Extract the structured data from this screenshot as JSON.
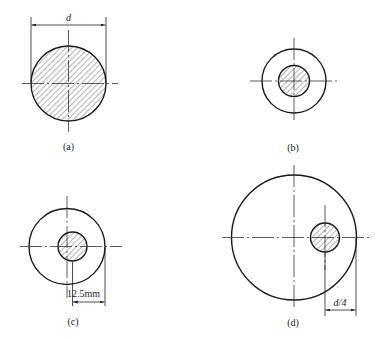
{
  "figures": [
    {
      "id": "a",
      "caption": "(a)",
      "description": "Solid round bar cross-section, fully hatched",
      "dimension": {
        "label": "d",
        "type": "diameter"
      }
    },
    {
      "id": "b",
      "caption": "(b)",
      "description": "Concentric hollow ring with hatched inner core"
    },
    {
      "id": "c",
      "caption": "(c)",
      "description": "Ring with hatched core slightly offset from center",
      "dimension": {
        "label": "12.5mm",
        "type": "offset"
      }
    },
    {
      "id": "d",
      "caption": "(d)",
      "description": "Large circle with small hatched core offset toward the edge",
      "dimension": {
        "label": "d/4",
        "type": "offset"
      }
    }
  ],
  "colors": {
    "line": "#1a1a1a",
    "hatch": "#444444",
    "background": "#ffffff"
  }
}
